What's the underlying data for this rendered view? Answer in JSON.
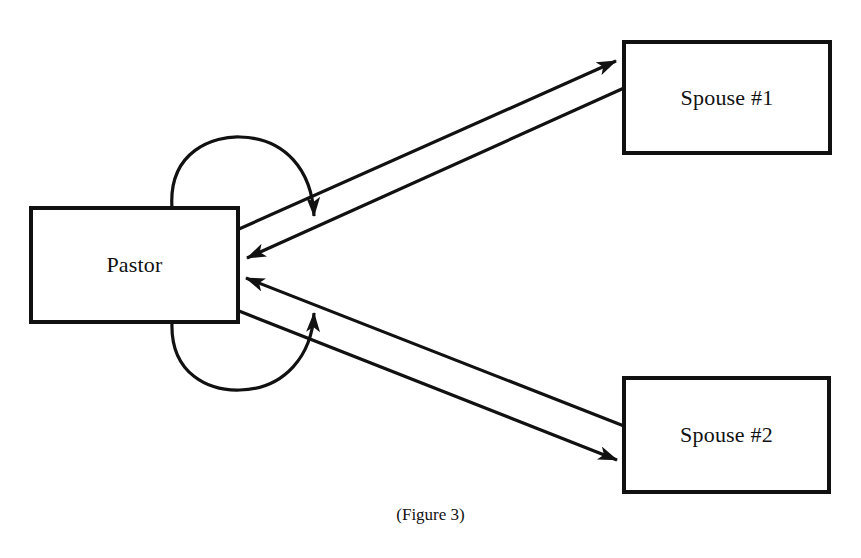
{
  "diagram": {
    "nodes": {
      "pastor": {
        "label": "Pastor"
      },
      "spouse1": {
        "label": "Spouse #1"
      },
      "spouse2": {
        "label": "Spouse #2"
      }
    },
    "edges": [
      {
        "from": "pastor",
        "to": "spouse1",
        "type": "arrow"
      },
      {
        "from": "spouse1",
        "to": "pastor",
        "type": "arrow"
      },
      {
        "from": "spouse2",
        "to": "pastor",
        "type": "arrow"
      },
      {
        "from": "pastor",
        "to": "spouse2",
        "type": "arrow"
      },
      {
        "from": "pastor",
        "to": "pastor",
        "type": "self-loop-top"
      },
      {
        "from": "pastor",
        "to": "pastor",
        "type": "self-loop-bottom"
      }
    ],
    "caption": "(Figure 3)",
    "colors": {
      "stroke": "#111111",
      "background": "#ffffff"
    }
  }
}
